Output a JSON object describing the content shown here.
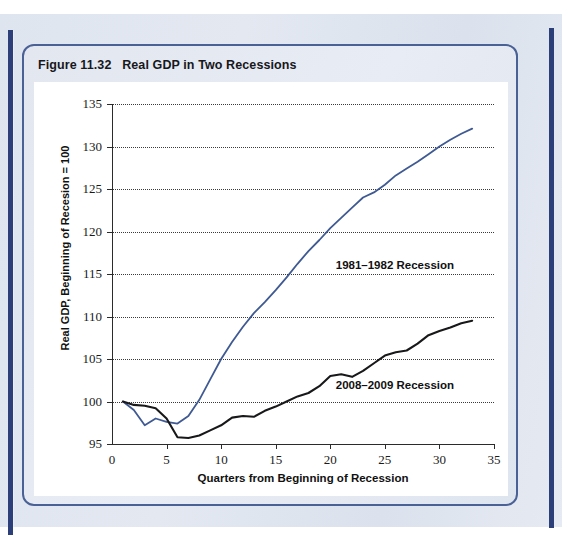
{
  "figure": {
    "number": "Figure 11.32",
    "caption": "Real GDP in Two Recessions"
  },
  "colors": {
    "series_1981": "#3f5a93",
    "series_2008": "#18181a",
    "card_border": "#4a6196",
    "page_rule": "#2c3f79",
    "page_background": "#e2e7f0",
    "plot_background": "#ffffff",
    "gridline": "#3a3a3a"
  },
  "chart_data": {
    "type": "line",
    "title": "Real GDP in Two Recessions",
    "xlabel": "Quarters from Beginning of Recession",
    "ylabel": "Real GDP, Beginning of Recesion = 100",
    "xlim": [
      0,
      35
    ],
    "ylim": [
      95,
      135
    ],
    "xticks": [
      0,
      5,
      10,
      15,
      20,
      25,
      30,
      35
    ],
    "yticks": [
      95,
      100,
      105,
      110,
      115,
      120,
      125,
      130,
      135
    ],
    "grid": true,
    "grid_axis": "y",
    "legend": "inline-annotations",
    "annotations": [
      {
        "text": "1981–1982 Recession",
        "x": 20.5,
        "y": 116.0
      },
      {
        "text": "2008–2009 Recession",
        "x": 20.5,
        "y": 101.8
      }
    ],
    "series": [
      {
        "name": "1981–1982 Recession",
        "color": "#3f5a93",
        "x": [
          1,
          2,
          3,
          4,
          5,
          6,
          7,
          8,
          9,
          10,
          11,
          12,
          13,
          14,
          15,
          16,
          17,
          18,
          19,
          20,
          21,
          22,
          23,
          24,
          25,
          26,
          27,
          28,
          29,
          30,
          31,
          32,
          33
        ],
        "y": [
          100.0,
          99.0,
          97.2,
          98.0,
          97.6,
          97.4,
          98.3,
          100.2,
          102.6,
          105.0,
          107.0,
          108.8,
          110.4,
          111.7,
          113.1,
          114.6,
          116.2,
          117.7,
          119.0,
          120.4,
          121.6,
          122.8,
          124.0,
          124.6,
          125.5,
          126.6,
          127.4,
          128.2,
          129.1,
          130.0,
          130.8,
          131.5,
          132.1
        ]
      },
      {
        "name": "2008–2009 Recession",
        "color": "#18181a",
        "x": [
          1,
          2,
          3,
          4,
          5,
          6,
          7,
          8,
          9,
          10,
          11,
          12,
          13,
          14,
          15,
          16,
          17,
          18,
          19,
          20,
          21,
          22,
          23,
          24,
          25,
          26,
          27,
          28,
          29,
          30,
          31,
          32,
          33
        ],
        "y": [
          100.0,
          99.6,
          99.5,
          99.2,
          98.0,
          95.8,
          95.7,
          96.0,
          96.6,
          97.2,
          98.1,
          98.3,
          98.2,
          98.9,
          99.4,
          100.0,
          100.6,
          101.0,
          101.8,
          103.0,
          103.2,
          102.9,
          103.6,
          104.5,
          105.4,
          105.8,
          106.0,
          106.8,
          107.8,
          108.3,
          108.7,
          109.2,
          109.5
        ]
      }
    ]
  }
}
